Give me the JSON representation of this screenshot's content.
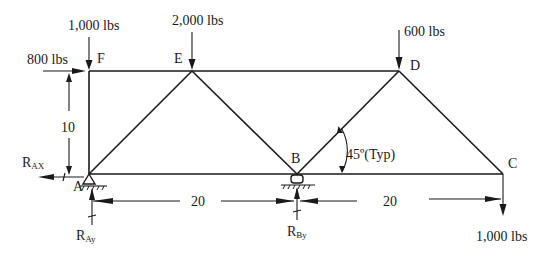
{
  "diagram": {
    "type": "truss",
    "nodes": [
      {
        "id": "F",
        "label": "F",
        "x": 89,
        "y": 71
      },
      {
        "id": "E",
        "label": "E",
        "x": 192,
        "y": 71
      },
      {
        "id": "D",
        "label": "D",
        "x": 399,
        "y": 71
      },
      {
        "id": "A",
        "label": "A",
        "x": 89,
        "y": 174
      },
      {
        "id": "B",
        "label": "B",
        "x": 297,
        "y": 174
      },
      {
        "id": "C",
        "label": "C",
        "x": 503,
        "y": 174
      }
    ],
    "members": [
      [
        "F",
        "E"
      ],
      [
        "E",
        "D"
      ],
      [
        "F",
        "A"
      ],
      [
        "A",
        "E"
      ],
      [
        "E",
        "B"
      ],
      [
        "B",
        "D"
      ],
      [
        "D",
        "C"
      ],
      [
        "A",
        "B"
      ],
      [
        "B",
        "C"
      ]
    ],
    "loads": {
      "F_vertical": "1,000 lbs",
      "F_horizontal": "800 lbs",
      "E_vertical": "2,000 lbs",
      "D_vertical": "600 lbs",
      "C_vertical": "1,000 lbs"
    },
    "reactions": {
      "RAx": {
        "main": "R",
        "sub": "AX"
      },
      "RAy": {
        "main": "R",
        "sub": "Ay"
      },
      "RBy": {
        "main": "R",
        "sub": "By"
      }
    },
    "dimensions": {
      "height": "10",
      "span_AB": "20",
      "span_BC": "20"
    },
    "angle_note": "45º(Typ)",
    "supports": {
      "A": "pin",
      "B": "roller"
    }
  }
}
